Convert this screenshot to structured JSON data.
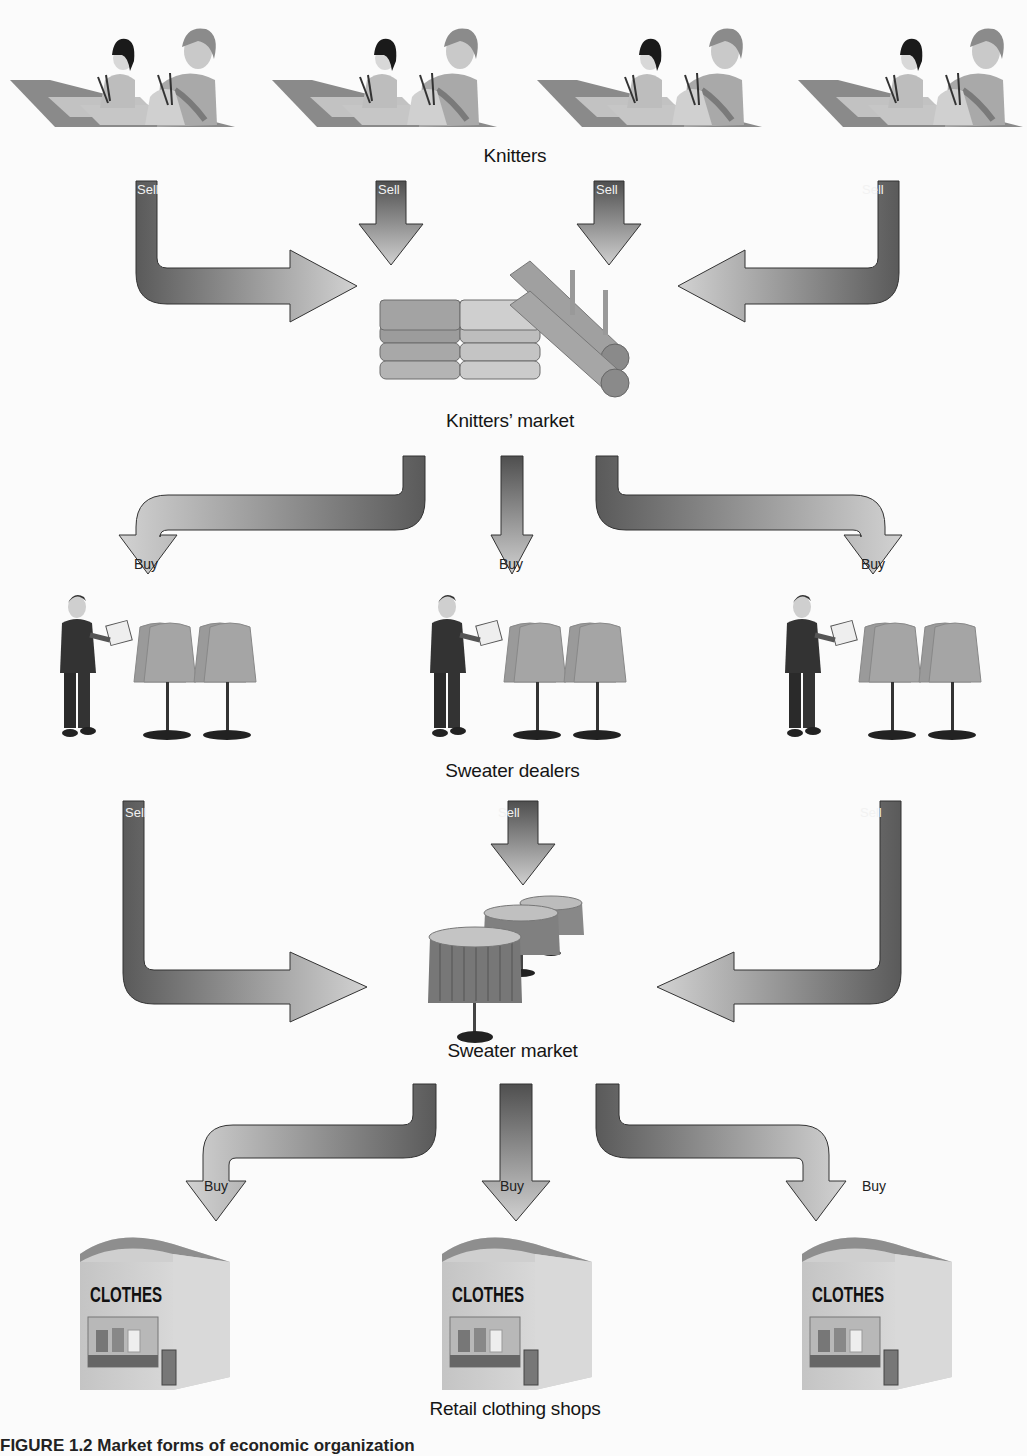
{
  "diagram": {
    "type": "flow-diagram",
    "stages": [
      {
        "id": "knitters",
        "label": "Knitters",
        "count": 4
      },
      {
        "id": "knitters_market",
        "label": "Knitters’ market"
      },
      {
        "id": "sweater_dealers",
        "label": "Sweater dealers",
        "count": 3
      },
      {
        "id": "sweater_market",
        "label": "Sweater market"
      },
      {
        "id": "retail_shops",
        "label": "Retail clothing shops",
        "count": 3
      }
    ],
    "arrows": {
      "sell_label": "Sell",
      "buy_label": "Buy"
    },
    "shop_sign": "CLOTHES",
    "caption": "FIGURE 1.2   Market forms of economic organization"
  },
  "colors": {
    "arrow_dark": "#5a5a5a",
    "arrow_light": "#d4d4d4",
    "background": "#fbfbfb",
    "text": "#151515"
  }
}
